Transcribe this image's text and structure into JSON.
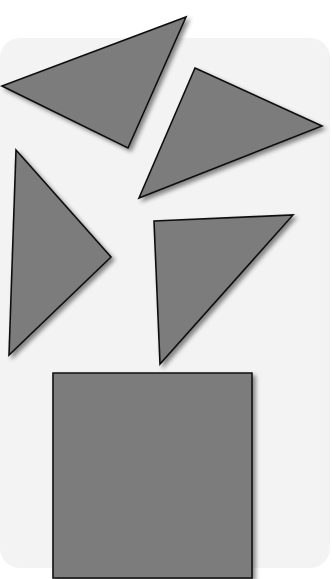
{
  "diagram": {
    "background": "#ffffff",
    "panel": {
      "color": "#f3f3f3",
      "x": 0,
      "y": 38,
      "width": 330,
      "height": 530,
      "radius": 20
    },
    "shape_fill": "#7b7b7b",
    "stroke": "#111111",
    "shapes": [
      {
        "name": "triangle-top-left",
        "type": "triangle",
        "points": "2,86 186,17 128,148"
      },
      {
        "name": "triangle-top-right",
        "type": "triangle",
        "points": "195,68 322,126 139,198"
      },
      {
        "name": "triangle-middle-left",
        "type": "triangle",
        "points": "16,150 111,257 9,355"
      },
      {
        "name": "triangle-middle-right",
        "type": "triangle",
        "points": "154,221 293,215 160,364"
      },
      {
        "name": "square-bottom",
        "type": "square",
        "points": "53,373 252,373 252,578 53,578"
      }
    ]
  }
}
